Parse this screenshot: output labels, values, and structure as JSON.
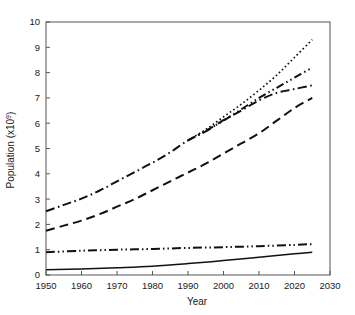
{
  "chart_data": {
    "type": "line",
    "title": "",
    "xlabel": "Year",
    "ylabel": "Population (x10⁹)",
    "xlim": [
      1950,
      2030
    ],
    "ylim": [
      0,
      10
    ],
    "grid": false,
    "legend": "none",
    "xticks": [
      1950,
      1960,
      1970,
      1980,
      1990,
      2000,
      2010,
      2020,
      2030
    ],
    "yticks": [
      0,
      1,
      2,
      3,
      4,
      5,
      6,
      7,
      8,
      9,
      10
    ],
    "series": [
      {
        "name": "high-projection",
        "style": "dotted",
        "x": [
          1990,
          1995,
          2000,
          2005,
          2010,
          2015,
          2020,
          2025
        ],
        "values": [
          5.32,
          5.75,
          6.25,
          6.75,
          7.3,
          7.9,
          8.6,
          9.3
        ]
      },
      {
        "name": "medium-high-projection",
        "style": "dash-dot-dot",
        "x": [
          1990,
          1995,
          2000,
          2005,
          2010,
          2015,
          2020,
          2025
        ],
        "values": [
          5.32,
          5.7,
          6.1,
          6.55,
          7.0,
          7.4,
          7.8,
          8.2
        ]
      },
      {
        "name": "world-total",
        "style": "dash-dot",
        "x": [
          1950,
          1955,
          1960,
          1965,
          1970,
          1975,
          1980,
          1985,
          1990,
          1995,
          2000,
          2005,
          2010,
          2015,
          2020,
          2025
        ],
        "values": [
          2.52,
          2.77,
          3.02,
          3.33,
          3.7,
          4.07,
          4.44,
          4.85,
          5.32,
          5.68,
          6.12,
          6.5,
          6.9,
          7.2,
          7.35,
          7.5
        ]
      },
      {
        "name": "low-projection",
        "style": "dashed",
        "x": [
          1950,
          1955,
          1960,
          1965,
          1970,
          1975,
          1980,
          1985,
          1990,
          1995,
          2000,
          2005,
          2010,
          2015,
          2020,
          2025
        ],
        "values": [
          1.75,
          1.95,
          2.15,
          2.4,
          2.7,
          3.0,
          3.35,
          3.7,
          4.05,
          4.4,
          4.8,
          5.2,
          5.6,
          6.1,
          6.6,
          7.0
        ]
      },
      {
        "name": "developing-regions",
        "style": "dash-dot-dot-flat",
        "x": [
          1950,
          1960,
          1970,
          1980,
          1990,
          2000,
          2010,
          2020,
          2025
        ],
        "values": [
          0.9,
          0.96,
          1.0,
          1.03,
          1.07,
          1.1,
          1.14,
          1.19,
          1.22
        ]
      },
      {
        "name": "least-developed",
        "style": "solid",
        "x": [
          1950,
          1960,
          1970,
          1980,
          1990,
          2000,
          2010,
          2020,
          2025
        ],
        "values": [
          0.21,
          0.24,
          0.29,
          0.35,
          0.45,
          0.57,
          0.7,
          0.84,
          0.9
        ]
      }
    ]
  }
}
